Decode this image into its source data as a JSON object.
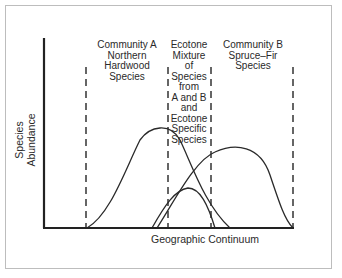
{
  "figure": {
    "y_axis_label": "Species Abundance",
    "x_axis_label": "Geographic Continuum",
    "zones": [
      {
        "label_lines": [
          "Community A",
          "Northern",
          "Hardwood",
          "Species"
        ]
      },
      {
        "label_lines": [
          "Ecotone",
          "Mixture",
          "of",
          "Species",
          "from",
          "A and B",
          "and",
          "Ecotone",
          "Specific",
          "Species"
        ]
      },
      {
        "label_lines": [
          "Community B",
          "Spruce–Fir",
          "Species"
        ]
      }
    ],
    "curves": [
      {
        "name": "Community A",
        "peak_position": "left",
        "relative_height": "tallest"
      },
      {
        "name": "Ecotone specific",
        "peak_position": "middle",
        "relative_height": "smallest"
      },
      {
        "name": "Community B",
        "peak_position": "right",
        "relative_height": "tall"
      }
    ],
    "boundaries": [
      "A start",
      "A/Ecotone",
      "Ecotone/B",
      "B end"
    ]
  }
}
